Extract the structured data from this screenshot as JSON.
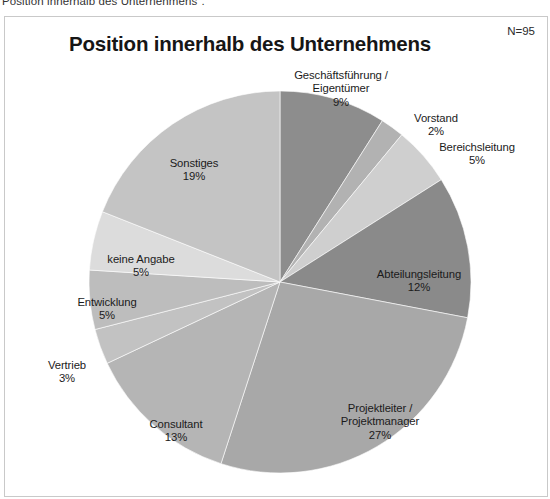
{
  "document": {
    "caption_clipped": "Position innerhalb des Unternehmens\"."
  },
  "chart_frame": {
    "title": "Position innerhalb des Unternehmens",
    "sample_size": "N=95"
  },
  "chart_data": {
    "type": "pie",
    "title": "Position innerhalb des Unternehmens",
    "xlabel": "",
    "ylabel": "",
    "annotations": [
      "N=95"
    ],
    "legend_position": "none",
    "labels_inline": true,
    "start_angle_deg": 0,
    "direction": "clockwise",
    "categories": [
      "Geschäftsführung / Eigentümer",
      "Vorstand",
      "Bereichsleitung",
      "Abteilungsleitung",
      "Projektleiter / Projektmanager",
      "Consultant",
      "Vertrieb",
      "Entwicklung",
      "keine Angabe",
      "Sonstiges"
    ],
    "values": [
      9,
      2,
      5,
      12,
      27,
      13,
      3,
      5,
      5,
      19
    ],
    "value_unit": "%",
    "colors": [
      "#8d8d8d",
      "#b2b2b2",
      "#cfcfcf",
      "#8a8a8a",
      "#a8a8a8",
      "#b5b5b5",
      "#c2c2c2",
      "#bdbdbd",
      "#dcdcdc",
      "#c4c4c4"
    ],
    "slices": [
      {
        "label": "Geschäftsführung /\nEigentümer",
        "percent_text": "9%",
        "value": 9,
        "color": "#8d8d8d"
      },
      {
        "label": "Vorstand",
        "percent_text": "2%",
        "value": 2,
        "color": "#b2b2b2"
      },
      {
        "label": "Bereichsleitung",
        "percent_text": "5%",
        "value": 5,
        "color": "#cfcfcf"
      },
      {
        "label": "Abteilungsleitung",
        "percent_text": "12%",
        "value": 12,
        "color": "#8a8a8a"
      },
      {
        "label": "Projektleiter /\nProjektmanager",
        "percent_text": "27%",
        "value": 27,
        "color": "#a8a8a8"
      },
      {
        "label": "Consultant",
        "percent_text": "13%",
        "value": 13,
        "color": "#b5b5b5"
      },
      {
        "label": "Vertrieb",
        "percent_text": "3%",
        "value": 3,
        "color": "#c2c2c2"
      },
      {
        "label": "Entwicklung",
        "percent_text": "5%",
        "value": 5,
        "color": "#bdbdbd"
      },
      {
        "label": "keine Angabe",
        "percent_text": "5%",
        "value": 5,
        "color": "#dcdcdc"
      },
      {
        "label": "Sonstiges",
        "percent_text": "19%",
        "value": 19,
        "color": "#c4c4c4"
      }
    ]
  }
}
